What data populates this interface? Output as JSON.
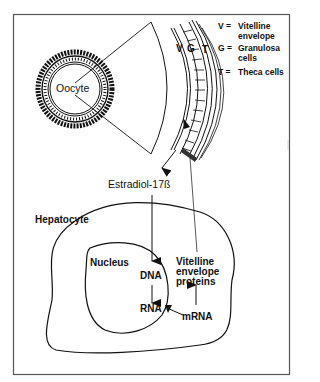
{
  "figure": {
    "type": "biological pathway diagram",
    "colors": {
      "stroke": "#1a1a1a",
      "frame": "#555555",
      "background": "#ffffff"
    }
  },
  "follicle": {
    "center_label": "Oocyte",
    "layer_markers": {
      "v": "V",
      "g": "G",
      "t": "T"
    }
  },
  "legend": {
    "items": [
      {
        "key": "V =",
        "line1": "Vitelline",
        "line2": "envelope"
      },
      {
        "key": "G =",
        "line1": "Granulosa",
        "line2": "cells"
      },
      {
        "key": "T =",
        "line1": "Theca cells",
        "line2": ""
      }
    ]
  },
  "hormone": {
    "label": "Estradiol-17ß"
  },
  "liver": {
    "cell_label": "Hepatocyte",
    "nucleus_label": "Nucleus",
    "dna": "DNA",
    "rna": "RNA",
    "mrna": "mRNA",
    "product_line1": "Vitelline",
    "product_line2": "envelope",
    "product_line3": "proteins"
  }
}
